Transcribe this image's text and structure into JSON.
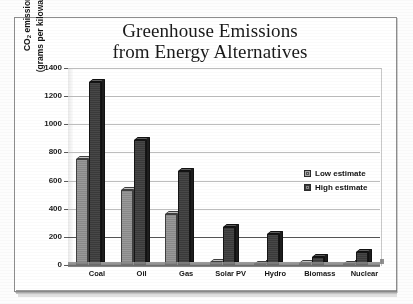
{
  "figure": {
    "title_line1": "Greenhouse Emissions",
    "title_line2": "from Energy Alternatives"
  },
  "chart_data": {
    "type": "bar",
    "title": "Greenhouse Emissions from Energy Alternatives",
    "xlabel": "",
    "ylabel": "CO2 emissions (grams per kilowatt-hour)",
    "ylabel_line1": "CO",
    "ylabel_sub": "2",
    "ylabel_line1_rest": " emissions",
    "ylabel_line2": "(grams per kilowatt-hour)",
    "categories": [
      "Coal",
      "Oil",
      "Gas",
      "Solar PV",
      "Hydro",
      "Biomass",
      "Nuclear"
    ],
    "series": [
      {
        "name": "Low estimate",
        "values": [
          750,
          530,
          360,
          20,
          5,
          15,
          2
        ]
      },
      {
        "name": "High estimate",
        "values": [
          1300,
          890,
          670,
          270,
          220,
          60,
          90
        ]
      }
    ],
    "ylim": [
      0,
      1400
    ],
    "ytick_values": [
      1400,
      1200,
      1000,
      800,
      600,
      400,
      200,
      0
    ],
    "ytick_labels": [
      "1400",
      "1200",
      "1000",
      "800",
      "600",
      "400",
      "200",
      "0"
    ],
    "grid": true,
    "legend_position": "upper-right-inside",
    "colors": {
      "low_estimate": "#9a9a9a",
      "high_estimate": "#3a3a3a",
      "gridline": "#bdbdbd",
      "axis": "#3d3d3d",
      "text": "#151515",
      "background": "#ffffff"
    }
  }
}
